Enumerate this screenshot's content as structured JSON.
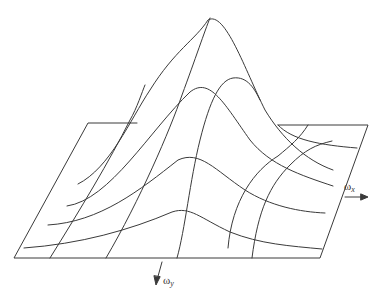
{
  "figure": {
    "axes": {
      "x": {
        "symbol": "ω",
        "subscript": "x"
      },
      "y": {
        "symbol": "ω",
        "subscript": "y"
      }
    },
    "colors": {
      "line": "#3a3a3a",
      "background": "#ffffff"
    }
  }
}
